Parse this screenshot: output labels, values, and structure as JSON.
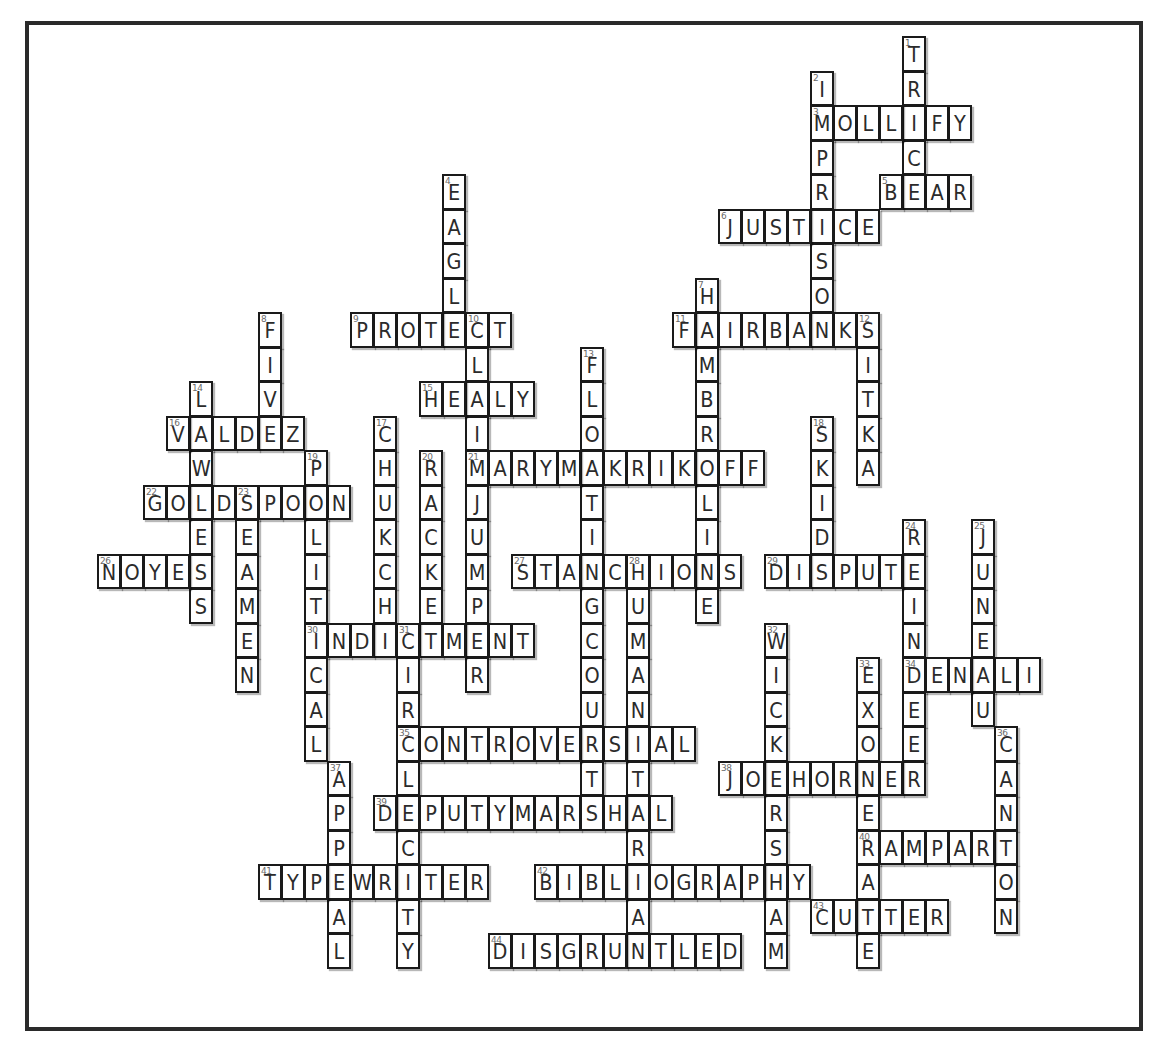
{
  "puzzle": {
    "grid": {
      "origin_x": 97,
      "origin_y": 36,
      "cell_w": 23,
      "cell_h": 34.5
    },
    "colors": {
      "border": "#1a1a1a",
      "letter": "#2b2b2b",
      "number": "#6a6a6a",
      "frame": "#2a2a2a",
      "background": "#ffffff"
    },
    "words": [
      {
        "num": 1,
        "dir": "down",
        "row": 0,
        "col": 35,
        "answer": "TRICE"
      },
      {
        "num": 2,
        "dir": "down",
        "row": 1,
        "col": 31,
        "answer": "IMPRISON"
      },
      {
        "num": 3,
        "dir": "across",
        "row": 2,
        "col": 31,
        "answer": "MOLLIFY"
      },
      {
        "num": 4,
        "dir": "down",
        "row": 4,
        "col": 15,
        "answer": "EAGLE"
      },
      {
        "num": 5,
        "dir": "across",
        "row": 4,
        "col": 34,
        "answer": "BEAR"
      },
      {
        "num": 6,
        "dir": "across",
        "row": 5,
        "col": 27,
        "answer": "JUSTICE"
      },
      {
        "num": 7,
        "dir": "down",
        "row": 7,
        "col": 26,
        "answer": "HAMBROLINE"
      },
      {
        "num": 8,
        "dir": "down",
        "row": 8,
        "col": 7,
        "answer": "FIVE"
      },
      {
        "num": 9,
        "dir": "across",
        "row": 8,
        "col": 11,
        "answer": "PROTECT"
      },
      {
        "num": 10,
        "dir": "down",
        "row": 8,
        "col": 16,
        "answer": "CLAIMJUMPER"
      },
      {
        "num": 11,
        "dir": "across",
        "row": 8,
        "col": 25,
        "answer": "FAIRBANKS"
      },
      {
        "num": 12,
        "dir": "down",
        "row": 8,
        "col": 33,
        "answer": "SITKA"
      },
      {
        "num": 13,
        "dir": "down",
        "row": 9,
        "col": 21,
        "answer": "FLOATINGCOURT"
      },
      {
        "num": 14,
        "dir": "down",
        "row": 10,
        "col": 4,
        "answer": "LAWLESS"
      },
      {
        "num": 15,
        "dir": "across",
        "row": 10,
        "col": 14,
        "answer": "HEALY"
      },
      {
        "num": 16,
        "dir": "across",
        "row": 11,
        "col": 3,
        "answer": "VALDEZ"
      },
      {
        "num": 17,
        "dir": "down",
        "row": 11,
        "col": 12,
        "answer": "CHUKCHI"
      },
      {
        "num": 18,
        "dir": "down",
        "row": 11,
        "col": 31,
        "answer": "SKIDS"
      },
      {
        "num": 19,
        "dir": "down",
        "row": 12,
        "col": 9,
        "answer": "POLITICAL"
      },
      {
        "num": 20,
        "dir": "down",
        "row": 12,
        "col": 14,
        "answer": "RACKET"
      },
      {
        "num": 21,
        "dir": "across",
        "row": 12,
        "col": 16,
        "answer": "MARYMAKRIKOFF"
      },
      {
        "num": 22,
        "dir": "across",
        "row": 13,
        "col": 2,
        "answer": "GOLDSPOON"
      },
      {
        "num": 23,
        "dir": "down",
        "row": 13,
        "col": 6,
        "answer": "SEAMEN"
      },
      {
        "num": 24,
        "dir": "down",
        "row": 14,
        "col": 35,
        "answer": "REINDEER"
      },
      {
        "num": 25,
        "dir": "down",
        "row": 14,
        "col": 38,
        "answer": "JUNEAU"
      },
      {
        "num": 26,
        "dir": "across",
        "row": 15,
        "col": 0,
        "answer": "NOYES"
      },
      {
        "num": 27,
        "dir": "across",
        "row": 15,
        "col": 18,
        "answer": "STANCHIONS"
      },
      {
        "num": 28,
        "dir": "down",
        "row": 15,
        "col": 23,
        "answer": "HUMANITARIAN"
      },
      {
        "num": 29,
        "dir": "across",
        "row": 15,
        "col": 29,
        "answer": "DISPUTE"
      },
      {
        "num": 30,
        "dir": "across",
        "row": 17,
        "col": 9,
        "answer": "INDICTMENT"
      },
      {
        "num": 31,
        "dir": "down",
        "row": 17,
        "col": 13,
        "answer": "CIRCLECITY"
      },
      {
        "num": 32,
        "dir": "down",
        "row": 17,
        "col": 29,
        "answer": "WICKERSHAM"
      },
      {
        "num": 33,
        "dir": "down",
        "row": 18,
        "col": 33,
        "answer": "EXONERATE"
      },
      {
        "num": 34,
        "dir": "across",
        "row": 18,
        "col": 35,
        "answer": "DENALI"
      },
      {
        "num": 35,
        "dir": "across",
        "row": 20,
        "col": 13,
        "answer": "CONTROVERSIAL"
      },
      {
        "num": 36,
        "dir": "down",
        "row": 20,
        "col": 39,
        "answer": "CANTON"
      },
      {
        "num": 37,
        "dir": "down",
        "row": 21,
        "col": 10,
        "answer": "APPEAL"
      },
      {
        "num": 38,
        "dir": "across",
        "row": 21,
        "col": 27,
        "answer": "JOEHORNER"
      },
      {
        "num": 39,
        "dir": "across",
        "row": 22,
        "col": 12,
        "answer": "DEPUTYMARSHAL"
      },
      {
        "num": 40,
        "dir": "across",
        "row": 23,
        "col": 33,
        "answer": "RAMPART"
      },
      {
        "num": 41,
        "dir": "across",
        "row": 24,
        "col": 7,
        "answer": "TYPEWRITER"
      },
      {
        "num": 42,
        "dir": "across",
        "row": 24,
        "col": 19,
        "answer": "BIBLIOGRAPHY"
      },
      {
        "num": 43,
        "dir": "across",
        "row": 25,
        "col": 31,
        "answer": "CUTTER"
      },
      {
        "num": 44,
        "dir": "across",
        "row": 26,
        "col": 17,
        "answer": "DISGRUNTLED"
      }
    ]
  }
}
